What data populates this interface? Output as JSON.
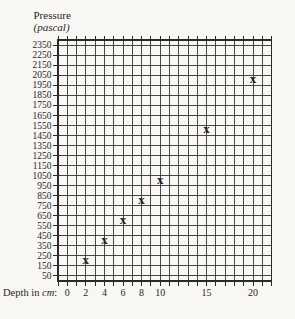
{
  "figure": {
    "y_axis_title_line1": "Pressure",
    "y_axis_title_line2": "(pascal)",
    "x_axis_label_prefix": "Depth in ",
    "x_axis_label_italic": "cm",
    "x_axis_label_suffix": ":"
  },
  "colors": {
    "paper": "#f8f7f3",
    "ink": "#262626",
    "grid": "#343434"
  },
  "chart_data": {
    "type": "scatter",
    "marker_glyph": "x",
    "ylabel": "Pressure (pascal)",
    "xlabel": "Depth in cm:",
    "x": [
      2,
      4,
      6,
      8,
      10,
      15,
      20
    ],
    "y": [
      200,
      400,
      600,
      800,
      1000,
      1500,
      2000
    ],
    "x_tick_labels": [
      0,
      2,
      4,
      6,
      8,
      10,
      15,
      20
    ],
    "y_tick_labels": [
      2350,
      2250,
      2150,
      2050,
      1950,
      1850,
      1750,
      1650,
      1550,
      1450,
      1350,
      1250,
      1150,
      1050,
      950,
      850,
      750,
      650,
      550,
      450,
      350,
      250,
      150,
      50
    ],
    "xlim": [
      -1,
      22
    ],
    "ylim": [
      0,
      2400
    ],
    "grid": true,
    "x_gridline_every_cm": 1,
    "y_gridline_every_pascal": 100,
    "legend": "none"
  }
}
